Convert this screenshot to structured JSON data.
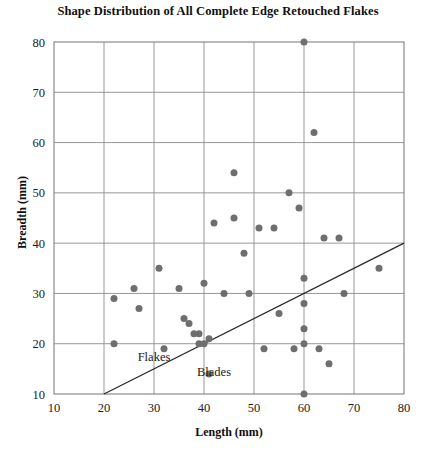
{
  "chart_data": {
    "type": "scatter",
    "title": "Shape Distribution of All Complete Edge Retouched Flakes",
    "xlabel": "Length (mm)",
    "ylabel": "Breadth (mm)",
    "xlim": [
      10,
      80
    ],
    "ylim": [
      10,
      80
    ],
    "xticks": [
      10,
      20,
      30,
      40,
      50,
      60,
      70,
      80
    ],
    "yticks": [
      10,
      20,
      30,
      40,
      50,
      60,
      70,
      80
    ],
    "grid": true,
    "legend": "none",
    "marker_color": "#6e6e6e",
    "marker_size": 7,
    "points": [
      {
        "x": 22,
        "y": 29
      },
      {
        "x": 22,
        "y": 20
      },
      {
        "x": 26,
        "y": 31
      },
      {
        "x": 27,
        "y": 27
      },
      {
        "x": 31,
        "y": 35
      },
      {
        "x": 32,
        "y": 19
      },
      {
        "x": 35,
        "y": 31
      },
      {
        "x": 36,
        "y": 25
      },
      {
        "x": 37,
        "y": 24
      },
      {
        "x": 38,
        "y": 22
      },
      {
        "x": 39,
        "y": 22
      },
      {
        "x": 39,
        "y": 20
      },
      {
        "x": 40,
        "y": 20
      },
      {
        "x": 40,
        "y": 32
      },
      {
        "x": 41,
        "y": 21
      },
      {
        "x": 41,
        "y": 14
      },
      {
        "x": 42,
        "y": 44
      },
      {
        "x": 44,
        "y": 30
      },
      {
        "x": 46,
        "y": 54
      },
      {
        "x": 46,
        "y": 45
      },
      {
        "x": 48,
        "y": 38
      },
      {
        "x": 49,
        "y": 30
      },
      {
        "x": 51,
        "y": 43
      },
      {
        "x": 52,
        "y": 19
      },
      {
        "x": 54,
        "y": 43
      },
      {
        "x": 55,
        "y": 26
      },
      {
        "x": 57,
        "y": 50
      },
      {
        "x": 58,
        "y": 19
      },
      {
        "x": 59,
        "y": 47
      },
      {
        "x": 60,
        "y": 80
      },
      {
        "x": 60,
        "y": 33
      },
      {
        "x": 60,
        "y": 28
      },
      {
        "x": 60,
        "y": 23
      },
      {
        "x": 60,
        "y": 20
      },
      {
        "x": 60,
        "y": 10
      },
      {
        "x": 62,
        "y": 62
      },
      {
        "x": 63,
        "y": 19
      },
      {
        "x": 64,
        "y": 41
      },
      {
        "x": 65,
        "y": 16
      },
      {
        "x": 67,
        "y": 41
      },
      {
        "x": 68,
        "y": 30
      },
      {
        "x": 75,
        "y": 35
      }
    ],
    "annotations": [
      {
        "label": "Flakes",
        "x": 30,
        "y": 16.5
      },
      {
        "label": "Blades",
        "x": 42,
        "y": 13.5
      }
    ],
    "reference_line": {
      "label": "flake-blade-boundary",
      "x1": 20,
      "y1": 10,
      "x2": 80,
      "y2": 40
    }
  }
}
